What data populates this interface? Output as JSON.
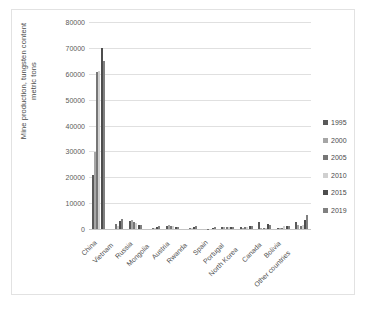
{
  "chart_data": {
    "type": "bar",
    "title": "",
    "xlabel": "",
    "ylabel": "Mine production, tungsten content metric tons",
    "ylabel_line1": "Mine production, tungsten content",
    "ylabel_line2": "metric tons",
    "ylim": [
      0,
      80000
    ],
    "ytick_step": 10000,
    "yticks": [
      "80000",
      "70000",
      "60000",
      "50000",
      "40000",
      "30000",
      "20000",
      "10000",
      "0"
    ],
    "grid": true,
    "legend_position": "right",
    "categories": [
      "China",
      "Vietnam",
      "Russia",
      "Mongolia",
      "Austria",
      "Rwanda",
      "Spain",
      "Portugal",
      "North Korea",
      "Canada",
      "Bolivia",
      "Other countries"
    ],
    "series": [
      {
        "name": "1995",
        "color": "#595959",
        "values": [
          20900,
          0,
          3000,
          0,
          1200,
          0,
          0,
          900,
          600,
          2600,
          400,
          2600
        ]
      },
      {
        "name": "2000",
        "color": "#a6a6a6",
        "values": [
          29900,
          0,
          3400,
          0,
          1400,
          0,
          0,
          800,
          500,
          300,
          400,
          1400
        ]
      },
      {
        "name": "2005",
        "color": "#767676",
        "values": [
          60500,
          2100,
          2700,
          200,
          1200,
          250,
          40,
          700,
          600,
          300,
          500,
          1300
        ]
      },
      {
        "name": "2010",
        "color": "#d0d0d0",
        "values": [
          61000,
          1300,
          2500,
          200,
          1000,
          300,
          40,
          700,
          600,
          400,
          1100,
          1500
        ]
      },
      {
        "name": "2015",
        "color": "#4d4d4d",
        "values": [
          70000,
          3200,
          1600,
          800,
          900,
          800,
          400,
          700,
          1000,
          2100,
          1200,
          3600
        ]
      },
      {
        "name": "2019",
        "color": "#808080",
        "values": [
          65000,
          4000,
          1500,
          1000,
          800,
          1000,
          700,
          700,
          1300,
          1400,
          1300,
          5400
        ]
      }
    ]
  },
  "legend": {
    "items": [
      {
        "label": "1995",
        "color": "#595959"
      },
      {
        "label": "2000",
        "color": "#a6a6a6"
      },
      {
        "label": "2005",
        "color": "#767676"
      },
      {
        "label": "2010",
        "color": "#d0d0d0"
      },
      {
        "label": "2015",
        "color": "#4d4d4d"
      },
      {
        "label": "2019",
        "color": "#808080"
      }
    ]
  }
}
